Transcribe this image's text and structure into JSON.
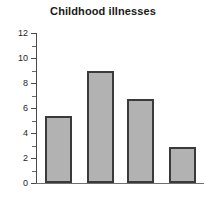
{
  "chart_data": {
    "type": "bar",
    "title": "Childhood illnesses",
    "xlabel": "",
    "ylabel": "",
    "categories": [
      "",
      "",
      "",
      ""
    ],
    "values": [
      5.4,
      9.0,
      6.7,
      2.9
    ],
    "ylim": [
      0,
      12
    ],
    "y_major_ticks": [
      0,
      2,
      4,
      6,
      8,
      10,
      12
    ],
    "y_minor_ticks": [
      1,
      3,
      5,
      7,
      9,
      11
    ],
    "y_tick_labels": [
      "0",
      "2",
      "4",
      "6",
      "8",
      "10",
      "12"
    ],
    "grid": false,
    "legend": null,
    "bar_fill_color": "#b2b2b2",
    "bar_edge_color": "#3a3a3a",
    "background_color": "#ffffff",
    "axis_color": "#4a4a4a"
  }
}
